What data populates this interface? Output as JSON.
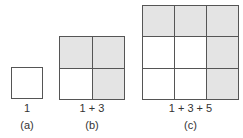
{
  "figures": [
    {
      "id": "a",
      "n": 1,
      "shaded": [
        [
          false
        ]
      ],
      "sum_label": "1",
      "caption": "(a)"
    },
    {
      "id": "b",
      "n": 2,
      "shaded": [
        [
          true,
          true
        ],
        [
          false,
          true
        ]
      ],
      "sum_label": "1 + 3",
      "caption": "(b)"
    },
    {
      "id": "c",
      "n": 3,
      "shaded": [
        [
          true,
          true,
          true
        ],
        [
          false,
          false,
          true
        ],
        [
          false,
          false,
          true
        ]
      ],
      "sum_label": "1 + 3 + 5",
      "caption": "(c)"
    }
  ],
  "colors": {
    "shade": "#e4e4e4",
    "line": "#555555",
    "blank": "#ffffff"
  }
}
